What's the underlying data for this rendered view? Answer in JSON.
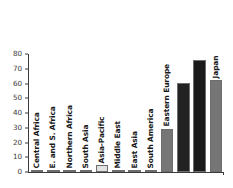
{
  "chart_data": {
    "type": "bar",
    "title": "",
    "xlabel": "",
    "ylabel": "",
    "ylim": [
      0,
      80
    ],
    "yticks": [
      0,
      10,
      20,
      30,
      40,
      50,
      60,
      70,
      80
    ],
    "ytick_labels": [
      "0",
      "10",
      "20",
      "30",
      "40",
      "50",
      "60",
      "70",
      "80"
    ],
    "grid": false,
    "legend": "none",
    "categories": [
      "Central Africa",
      "E. and S. Africa",
      "Northern Africa",
      "South Asia",
      "Asia-Pacific",
      "Middle East",
      "East Asia",
      "South America",
      "Eastern Europe",
      "North America",
      "Western Europe",
      "Japan"
    ],
    "values": [
      1.2,
      1.2,
      1.0,
      1.2,
      4.5,
      1.2,
      1.2,
      1.3,
      29.3,
      60.4,
      76.2,
      62.3
    ],
    "bar_colors": [
      "#6d6d6d",
      "#6d6d6d",
      "#6d6d6d",
      "#6d6d6d",
      "#e2e2e2",
      "#6d6d6d",
      "#6d6d6d",
      "#6d6d6d",
      "#767676",
      "#222222",
      "#1a1a1a",
      "#767676"
    ],
    "label_on_dark": [
      false,
      false,
      false,
      false,
      false,
      false,
      false,
      false,
      false,
      true,
      true,
      false
    ]
  }
}
